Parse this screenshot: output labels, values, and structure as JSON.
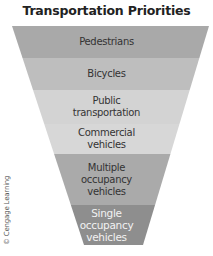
{
  "title": "Transportation Priorities",
  "funnel": {
    "levels": [
      {
        "lines": [
          "Pedestrians"
        ],
        "color": "#a9a9a9"
      },
      {
        "lines": [
          "Bicycles"
        ],
        "color": "#bebebe"
      },
      {
        "lines": [
          "Public",
          "transportation"
        ],
        "color": "#d3d3d3"
      },
      {
        "lines": [
          "Commercial",
          "vehicles"
        ],
        "color": "#d7d7d7"
      },
      {
        "lines": [
          "Multiple",
          "occupancy",
          "vehicles"
        ],
        "color": "#aaaaaa"
      },
      {
        "lines": [
          "Single",
          "occupancy",
          "vehicles"
        ],
        "color": "#8e8e8e"
      }
    ]
  },
  "credit": "© Cengage Learning"
}
